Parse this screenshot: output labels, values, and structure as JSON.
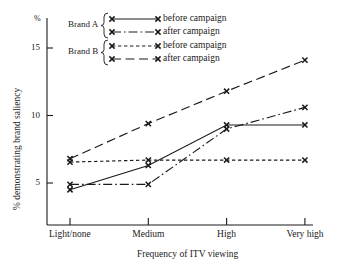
{
  "chart_data": {
    "type": "line",
    "title": "",
    "xlabel": "Frequency of ITV viewing",
    "ylabel": "% demonstrating brand saliency",
    "unit_symbol": "%",
    "categories": [
      "Light/none",
      "Medium",
      "High",
      "Very high"
    ],
    "ylim": [
      3.0,
      16.5
    ],
    "yticks": [
      5,
      10,
      15
    ],
    "ytick_labels": [
      "5",
      "10",
      "15"
    ],
    "grid": false,
    "legend_position": "top-center",
    "series": [
      {
        "name": "Brand A before campaign",
        "group": "Brand A",
        "phase": "before campaign",
        "style": "solid",
        "values": [
          4.5,
          6.3,
          9.3,
          9.3
        ]
      },
      {
        "name": "Brand A after campaign",
        "group": "Brand A",
        "phase": "after campaign",
        "style": "dash-dot",
        "values": [
          4.9,
          4.9,
          9.0,
          10.6
        ]
      },
      {
        "name": "Brand B before campaign",
        "group": "Brand B",
        "phase": "before campaign",
        "style": "short-dash",
        "values": [
          6.55,
          6.7,
          6.7,
          6.7
        ]
      },
      {
        "name": "Brand B after campaign",
        "group": "Brand B",
        "phase": "after campaign",
        "style": "long-dash",
        "values": [
          6.8,
          9.4,
          11.8,
          14.1
        ]
      }
    ]
  },
  "legend": {
    "groups": [
      {
        "brand_label": "Brand A",
        "entries": [
          {
            "label": "before campaign",
            "style": "solid"
          },
          {
            "label": "after campaign",
            "style": "dash-dot"
          }
        ]
      },
      {
        "brand_label": "Brand B",
        "entries": [
          {
            "label": "before campaign",
            "style": "short-dash"
          },
          {
            "label": "after campaign",
            "style": "long-dash"
          }
        ]
      }
    ]
  },
  "colors": {
    "ink": "#1a1a1a",
    "background": "#ffffff"
  }
}
